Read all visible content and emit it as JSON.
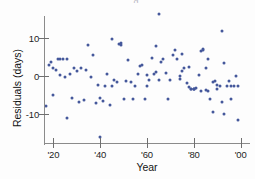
{
  "figure": {
    "background_color": "#fdfdfd",
    "point_color": "#45589b",
    "axis_color": "#8b8b8b",
    "clipped_title_fragment": "g"
  },
  "chart_data": {
    "type": "scatter",
    "title": "",
    "xlabel": "Year",
    "ylabel": "Residuals (days)",
    "xlim": [
      1916,
      2004
    ],
    "ylim": [
      -17,
      18
    ],
    "grid": false,
    "legend": null,
    "xtick_labels": [
      "'20",
      "'40",
      "'60",
      "'80",
      "'00"
    ],
    "xtick_values": [
      1920,
      1940,
      1960,
      1980,
      2000
    ],
    "ytick_labels": [
      "10",
      "0",
      "-10"
    ],
    "ytick_values": [
      10,
      0,
      -10
    ],
    "series": [
      {
        "name": "Residuals",
        "marker": "circle",
        "color": "#45589b",
        "points": [
          [
            1917,
            -8.0
          ],
          [
            1918,
            2.8
          ],
          [
            1919,
            3.6
          ],
          [
            1920,
            2.0
          ],
          [
            1920,
            -5.2
          ],
          [
            1921,
            1.6
          ],
          [
            1922,
            4.4
          ],
          [
            1923,
            4.6
          ],
          [
            1923,
            0.2
          ],
          [
            1924,
            4.4
          ],
          [
            1925,
            -0.2
          ],
          [
            1926,
            4.4
          ],
          [
            1926,
            -11.2
          ],
          [
            1927,
            0.4
          ],
          [
            1928,
            -5.8
          ],
          [
            1929,
            2.2
          ],
          [
            1930,
            1.4
          ],
          [
            1931,
            -6.8
          ],
          [
            1932,
            2.2
          ],
          [
            1933,
            -6.4
          ],
          [
            1934,
            1.6
          ],
          [
            1935,
            8.2
          ],
          [
            1936,
            -0.2
          ],
          [
            1937,
            5.6
          ],
          [
            1938,
            -7.2
          ],
          [
            1939,
            -2.4
          ],
          [
            1940,
            -5.8
          ],
          [
            1940,
            -16.2
          ],
          [
            1941,
            -6.6
          ],
          [
            1942,
            -2.8
          ],
          [
            1943,
            0.4
          ],
          [
            1944,
            -7.8
          ],
          [
            1945,
            9.8
          ],
          [
            1945,
            -2.8
          ],
          [
            1946,
            -1.0
          ],
          [
            1947,
            -1.6
          ],
          [
            1948,
            8.4
          ],
          [
            1949,
            8.6
          ],
          [
            1949,
            8.2
          ],
          [
            1950,
            -6.2
          ],
          [
            1951,
            -1.4
          ],
          [
            1952,
            4.2
          ],
          [
            1953,
            -1.6
          ],
          [
            1954,
            -6.0
          ],
          [
            1955,
            -2.8
          ],
          [
            1956,
            0.6
          ],
          [
            1957,
            2.6
          ],
          [
            1958,
            3.0
          ],
          [
            1959,
            -6.0
          ],
          [
            1960,
            0.2
          ],
          [
            1960,
            -2.8
          ],
          [
            1961,
            -1.2
          ],
          [
            1962,
            4.8
          ],
          [
            1963,
            0.6
          ],
          [
            1964,
            1.0
          ],
          [
            1964,
            7.8
          ],
          [
            1965,
            16.4
          ],
          [
            1965,
            -1.2
          ],
          [
            1966,
            3.6
          ],
          [
            1967,
            4.6
          ],
          [
            1968,
            0.8
          ],
          [
            1969,
            -6.2
          ],
          [
            1970,
            -1.0
          ],
          [
            1971,
            5.6
          ],
          [
            1972,
            6.8
          ],
          [
            1973,
            4.6
          ],
          [
            1974,
            0.0
          ],
          [
            1974,
            -0.8
          ],
          [
            1975,
            1.2
          ],
          [
            1975,
            5.8
          ],
          [
            1976,
            2.2
          ],
          [
            1977,
            -2.0
          ],
          [
            1978,
            2.4
          ],
          [
            1978,
            -3.0
          ],
          [
            1979,
            -3.4
          ],
          [
            1979,
            -3.6
          ],
          [
            1980,
            -3.4
          ],
          [
            1980,
            -3.4
          ],
          [
            1980,
            -3.4
          ],
          [
            1981,
            -3.2
          ],
          [
            1982,
            0.2
          ],
          [
            1983,
            6.6
          ],
          [
            1983,
            -4.0
          ],
          [
            1984,
            7.0
          ],
          [
            1984,
            6.8
          ],
          [
            1985,
            2.0
          ],
          [
            1985,
            -3.8
          ],
          [
            1986,
            4.6
          ],
          [
            1986,
            -4.0
          ],
          [
            1987,
            -6.0
          ],
          [
            1988,
            -1.6
          ],
          [
            1988,
            -9.6
          ],
          [
            1989,
            -1.4
          ],
          [
            1990,
            -2.4
          ],
          [
            1990,
            -3.6
          ],
          [
            1991,
            -2.8
          ],
          [
            1992,
            11.8
          ],
          [
            1992,
            -7.0
          ],
          [
            1993,
            3.4
          ],
          [
            1993,
            -10.0
          ],
          [
            1994,
            -2.8
          ],
          [
            1995,
            -1.4
          ],
          [
            1996,
            -2.6
          ],
          [
            1996,
            -6.0
          ],
          [
            1997,
            -2.8
          ],
          [
            1998,
            0.0
          ],
          [
            1999,
            -2.6
          ],
          [
            1999,
            -11.8
          ]
        ]
      }
    ]
  }
}
